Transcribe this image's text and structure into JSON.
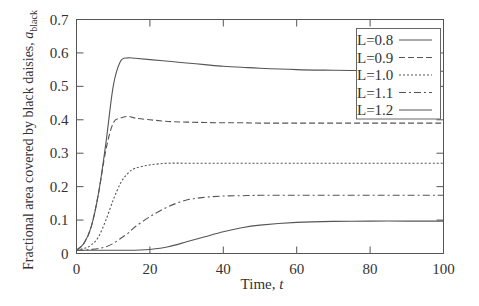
{
  "chart_data": {
    "type": "line",
    "title": "",
    "xlabel": "Time, t",
    "ylabel": "Fractional area covered by black daisies, a_black",
    "ylabel_main": "Fractional area covered by black daisies, ",
    "ylabel_var": "a",
    "ylabel_sub": "black",
    "xlabel_main": "Time, ",
    "xlabel_var": "t",
    "xlim": [
      0,
      100
    ],
    "ylim": [
      0,
      0.7
    ],
    "xticks": [
      0,
      20,
      40,
      60,
      80,
      100
    ],
    "yticks": [
      0,
      0.1,
      0.2,
      0.3,
      0.4,
      0.5,
      0.6,
      0.7
    ],
    "ytick_labels": [
      "0",
      "0.1",
      "0.2",
      "0.3",
      "0.4",
      "0.5",
      "0.6",
      "0.7"
    ],
    "grid": false,
    "legend_position": "upper right",
    "x": [
      0,
      2,
      4,
      6,
      8,
      10,
      12,
      14,
      16,
      20,
      25,
      30,
      35,
      40,
      45,
      50,
      60,
      70,
      80,
      90,
      100
    ],
    "series": [
      {
        "name": "L=0.8",
        "style": "solid",
        "values": [
          0.01,
          0.03,
          0.08,
          0.18,
          0.33,
          0.5,
          0.575,
          0.585,
          0.584,
          0.58,
          0.575,
          0.57,
          0.565,
          0.56,
          0.557,
          0.554,
          0.55,
          0.548,
          0.547,
          0.546,
          0.545
        ]
      },
      {
        "name": "L=0.9",
        "style": "dashed",
        "values": [
          0.01,
          0.03,
          0.08,
          0.18,
          0.31,
          0.39,
          0.405,
          0.41,
          0.405,
          0.4,
          0.395,
          0.393,
          0.392,
          0.391,
          0.391,
          0.39,
          0.39,
          0.39,
          0.39,
          0.39,
          0.39
        ]
      },
      {
        "name": "L=1.0",
        "style": "dotted",
        "values": [
          0.01,
          0.015,
          0.025,
          0.05,
          0.1,
          0.16,
          0.21,
          0.24,
          0.255,
          0.265,
          0.27,
          0.27,
          0.27,
          0.27,
          0.27,
          0.27,
          0.27,
          0.27,
          0.27,
          0.27,
          0.27
        ]
      },
      {
        "name": "L=1.1",
        "style": "dashdot",
        "values": [
          0.01,
          0.01,
          0.012,
          0.015,
          0.02,
          0.03,
          0.045,
          0.06,
          0.08,
          0.11,
          0.14,
          0.16,
          0.168,
          0.172,
          0.173,
          0.174,
          0.174,
          0.174,
          0.174,
          0.174,
          0.174
        ]
      },
      {
        "name": "L=1.2",
        "style": "solid",
        "values": [
          0.01,
          0.01,
          0.01,
          0.01,
          0.01,
          0.01,
          0.01,
          0.01,
          0.01,
          0.012,
          0.02,
          0.035,
          0.05,
          0.065,
          0.077,
          0.085,
          0.093,
          0.096,
          0.097,
          0.097,
          0.097
        ]
      }
    ],
    "legend_entries": [
      "L=0.8",
      "L=0.9",
      "L=1.0",
      "L=1.1",
      "L=1.2"
    ],
    "colors": {
      "line": "#555555",
      "axis": "#444444",
      "text": "#333333"
    }
  }
}
